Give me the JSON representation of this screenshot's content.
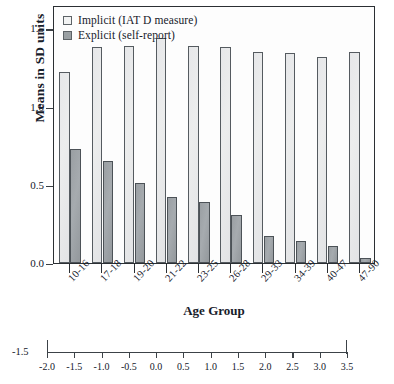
{
  "chart_data": {
    "type": "bar",
    "title": "",
    "xlabel": "Age Group",
    "ylabel": "Means in SD units",
    "categories": [
      "10-16",
      "17-18",
      "19-20",
      "21-22",
      "23-25",
      "26-28",
      "29-33",
      "34-39",
      "40-47",
      "47-90"
    ],
    "series": [
      {
        "name": "Implicit (IAT D measure)",
        "color": "#eceded",
        "values": [
          1.22,
          1.38,
          1.39,
          1.44,
          1.39,
          1.38,
          1.35,
          1.34,
          1.32,
          1.35
        ]
      },
      {
        "name": "Explicit (self-report)",
        "color": "#9aa0a3",
        "values": [
          0.73,
          0.65,
          0.51,
          0.42,
          0.39,
          0.31,
          0.17,
          0.14,
          0.11,
          0.03
        ]
      }
    ],
    "ylim": [
      0.0,
      1.65
    ],
    "yticks": [
      "0.0",
      "0.5",
      "1.0",
      "1.5"
    ],
    "ytick_values": [
      0.0,
      0.5,
      1.0,
      1.5
    ],
    "grid": false,
    "legend_position": "top-left"
  },
  "legend": {
    "items": [
      {
        "label": "Implicit (IAT D measure)"
      },
      {
        "label": "Explicit (self-report)"
      }
    ]
  },
  "secondary_axis": {
    "left_label": "-1.5",
    "ticks": [
      "-2.0",
      "-1.5",
      "-1.0",
      "-0.5",
      "0.0",
      "0.5",
      "1.0",
      "1.5",
      "2.0",
      "2.5",
      "3.0",
      "3.5"
    ],
    "tick_values": [
      -2.0,
      -1.5,
      -1.0,
      -0.5,
      0.0,
      0.5,
      1.0,
      1.5,
      2.0,
      2.5,
      3.0,
      3.5
    ]
  }
}
